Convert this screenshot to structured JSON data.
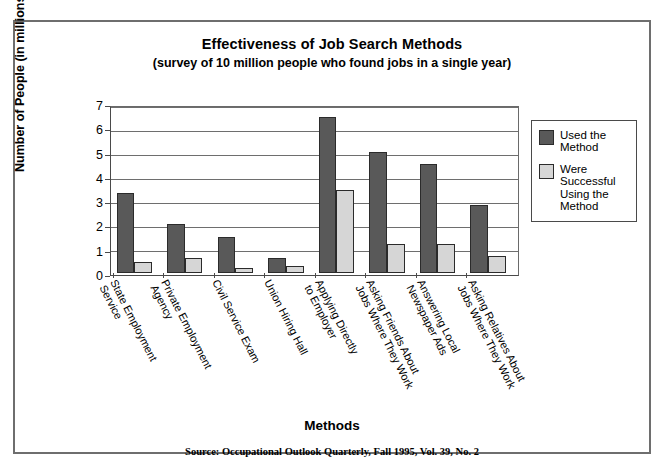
{
  "chart_data": {
    "type": "bar",
    "title": "Effectiveness of Job Search Methods",
    "subtitle": "(survey of 10 million people who found jobs in a single year)",
    "xlabel": "Methods",
    "ylabel": "Number of People (in millions)",
    "ylim": [
      0,
      7
    ],
    "yticks": [
      0,
      1,
      2,
      3,
      4,
      5,
      6,
      7
    ],
    "grid": true,
    "legend_position": "right",
    "source": "Source: Occupational Outlook Quarterly, Fall 1995, Vol. 39, No. 2",
    "categories": [
      "State Employment Service",
      "Private Employment Agency",
      "Civil Service Exam",
      "Union Hiring Hall",
      "Applying Directly to Employer",
      "Asking Friends About Jobs Where They Work",
      "Answering Local Newspaper Ads",
      "Asking Relatives About Jobs Where They Work"
    ],
    "category_lines": [
      [
        "State Employment",
        "Service"
      ],
      [
        "Private Employment",
        "Agency"
      ],
      [
        "Civil Service Exam"
      ],
      [
        "Union Hiring Hall"
      ],
      [
        "Applying Directly",
        "to Employer"
      ],
      [
        "Asking Friends About",
        "Jobs Where They Work"
      ],
      [
        "Answering Local",
        "Newspaper Ads"
      ],
      [
        "Asking Relatives About",
        "Jobs Where They Work"
      ]
    ],
    "series": [
      {
        "name": "Used the Method",
        "color": "#595959",
        "values": [
          3.4,
          2.1,
          1.55,
          0.65,
          6.65,
          5.15,
          4.65,
          2.9
        ]
      },
      {
        "name": "Were Successful Using the Method",
        "color": "#d6d6d6",
        "values": [
          0.5,
          0.65,
          0.25,
          0.3,
          3.55,
          1.25,
          1.25,
          0.75
        ]
      }
    ]
  },
  "legend": {
    "items": [
      {
        "label_lines": [
          "Used the",
          "Method"
        ],
        "color": "#595959"
      },
      {
        "label_lines": [
          "Were",
          "Successful",
          "Using the",
          "Method"
        ],
        "color": "#d6d6d6"
      }
    ]
  }
}
